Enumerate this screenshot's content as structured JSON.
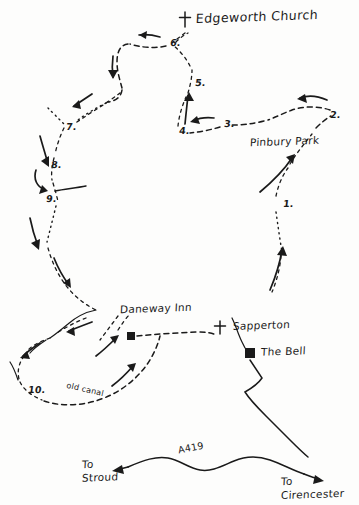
{
  "map": {
    "kind": "hand-drawn walking route map",
    "title": "Edgeworth Church",
    "ink_color": "#1a1a1a",
    "background_color": "#fdfdfc",
    "places": [
      {
        "id": "edgeworth-church",
        "label": "Edgeworth Church",
        "marker": "cross",
        "x": 196,
        "y": 18
      },
      {
        "id": "pinbury-park",
        "label": "Pinbury Park",
        "marker": "none",
        "x": 254,
        "y": 142
      },
      {
        "id": "daneway-inn",
        "label": "Daneway Inn",
        "marker": "filled-square",
        "x": 122,
        "y": 311
      },
      {
        "id": "sapperton",
        "label": "Sapperton",
        "marker": "cross",
        "x": 235,
        "y": 327
      },
      {
        "id": "the-bell",
        "label": "The Bell",
        "marker": "filled-square",
        "x": 262,
        "y": 352
      },
      {
        "id": "old-canal",
        "label": "old canal",
        "marker": "none",
        "x": 68,
        "y": 392
      }
    ],
    "waypoints": [
      {
        "n": "1.",
        "x": 283,
        "y": 204
      },
      {
        "n": "2.",
        "x": 330,
        "y": 116
      },
      {
        "n": "3.",
        "x": 225,
        "y": 124
      },
      {
        "n": "4.",
        "x": 181,
        "y": 131
      },
      {
        "n": "5.",
        "x": 196,
        "y": 83
      },
      {
        "n": "6.",
        "x": 172,
        "y": 44
      },
      {
        "n": "7.",
        "x": 68,
        "y": 128
      },
      {
        "n": "8.",
        "x": 53,
        "y": 165
      },
      {
        "n": "9.",
        "x": 48,
        "y": 199
      },
      {
        "n": "10.",
        "x": 31,
        "y": 390
      }
    ],
    "roads": [
      {
        "id": "a419",
        "label": "A419"
      },
      {
        "id": "to-stroud",
        "label": "To\nStroud",
        "line1": "To",
        "line2": "Stroud",
        "direction": "west"
      },
      {
        "id": "to-cirencester",
        "label": "To\nCirencester",
        "line1": "To",
        "line2": "Cirencester",
        "direction": "east"
      }
    ]
  }
}
